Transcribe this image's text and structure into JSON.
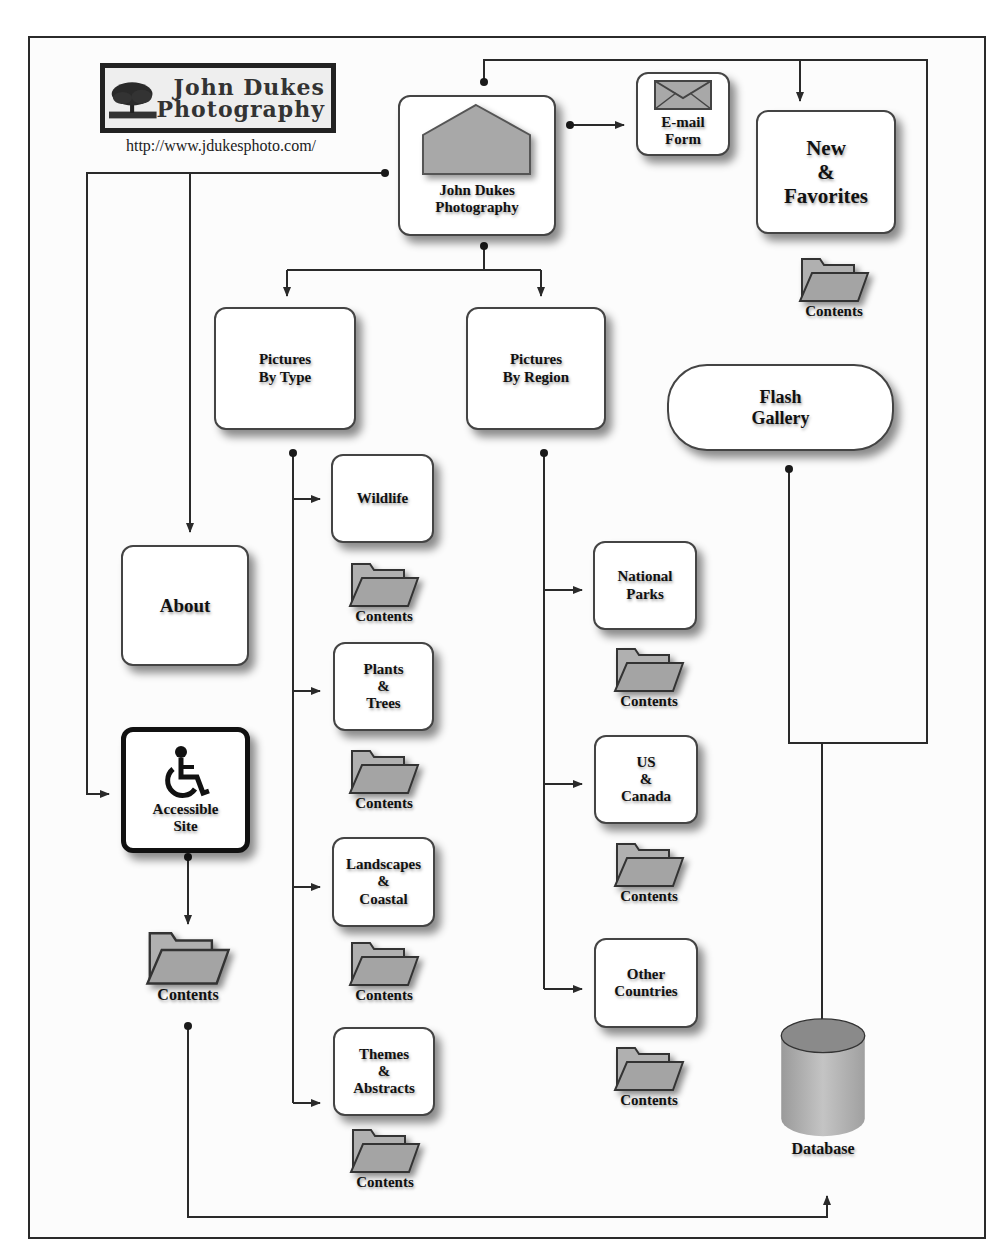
{
  "logo": {
    "line1": "John Dukes",
    "line2": "Photography",
    "url": "http://www.jdukesphoto.com/"
  },
  "nodes": {
    "home": {
      "label": "John Dukes\nPhotography",
      "icon": "house-icon"
    },
    "email": {
      "label": "E-mail\nForm",
      "icon": "envelope-icon"
    },
    "new_favorites": {
      "label": "New\n&\nFavorites"
    },
    "pictures_by_type": {
      "label": "Pictures\nBy Type"
    },
    "pictures_by_region": {
      "label": "Pictures\nBy Region"
    },
    "flash_gallery": {
      "label": "Flash\nGallery"
    },
    "about": {
      "label": "About"
    },
    "accessible_site": {
      "label": "Accessible\nSite",
      "icon": "wheelchair-icon"
    },
    "wildlife": {
      "label": "Wildlife"
    },
    "plants_trees": {
      "label": "Plants\n&\nTrees"
    },
    "landscapes_coastal": {
      "label": "Landscapes\n&\nCoastal"
    },
    "themes_abstracts": {
      "label": "Themes\n&\nAbstracts"
    },
    "national_parks": {
      "label": "National\nParks"
    },
    "us_canada": {
      "label": "US\n&\nCanada"
    },
    "other_countries": {
      "label": "Other\nCountries"
    },
    "database": {
      "label": "Database",
      "icon": "database-cylinder-icon"
    }
  },
  "folder_label": "Contents",
  "folders": [
    {
      "id": "new_favorites",
      "label": "Contents"
    },
    {
      "id": "wildlife",
      "label": "Contents"
    },
    {
      "id": "plants_trees",
      "label": "Contents"
    },
    {
      "id": "landscapes_coastal",
      "label": "Contents"
    },
    {
      "id": "themes_abstracts",
      "label": "Contents"
    },
    {
      "id": "national_parks",
      "label": "Contents"
    },
    {
      "id": "us_canada",
      "label": "Contents"
    },
    {
      "id": "other_countries",
      "label": "Contents"
    },
    {
      "id": "accessible_site",
      "label": "Contents"
    }
  ],
  "colors": {
    "line": "#2a2a2a",
    "icon_fill": "#a8a8a8",
    "db_top": "#8a8a8a",
    "db_body": "#b5b5b5"
  }
}
